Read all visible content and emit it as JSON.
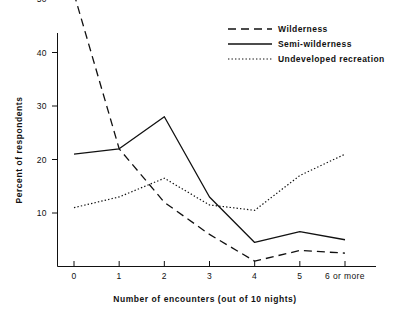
{
  "chart_data": {
    "type": "line",
    "title": "",
    "xlabel": "Number of encounters  (out of 10 nights)",
    "ylabel": "Percent of respondents",
    "categories": [
      "0",
      "1",
      "2",
      "3",
      "4",
      "5",
      "6 or more"
    ],
    "x": [
      0,
      1,
      2,
      3,
      4,
      5,
      6
    ],
    "xlim": [
      0,
      6
    ],
    "ylim": [
      0,
      55
    ],
    "grid": false,
    "legend_position": "top-right",
    "y_ticks": [
      10,
      20,
      30,
      40,
      50
    ],
    "y_tick_labels": [
      "10",
      "20",
      "30",
      "40",
      "50"
    ],
    "x_tick_labels": [
      "0",
      "1",
      "2",
      "3",
      "4",
      "5",
      "6 or more"
    ],
    "series": [
      {
        "name": "Wilderness",
        "style": "dashed",
        "color": "#111111",
        "values": [
          51,
          22,
          12,
          6,
          1,
          3,
          2.5
        ]
      },
      {
        "name": "Semi-wilderness",
        "style": "solid",
        "color": "#111111",
        "values": [
          21,
          22,
          28,
          13,
          4.5,
          6.5,
          5
        ]
      },
      {
        "name": "Undeveloped recreation",
        "style": "dotted",
        "color": "#111111",
        "values": [
          11,
          13,
          16.5,
          11.5,
          10.5,
          17,
          21
        ]
      }
    ]
  },
  "legend": {
    "items": [
      {
        "label": "Wilderness",
        "style": "dashed"
      },
      {
        "label": "Semi-wilderness",
        "style": "solid"
      },
      {
        "label": "Undeveloped recreation",
        "style": "dotted"
      }
    ]
  },
  "axes": {
    "y_title": "Percent of respondents",
    "x_title": "Number of encounters  (out of 10 nights)"
  }
}
